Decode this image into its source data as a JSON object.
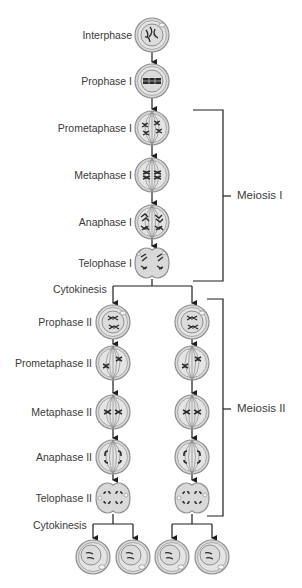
{
  "diagram": {
    "title": "Meiosis",
    "colors": {
      "line": "#1e1e1e",
      "cell_outer": "#a9a9a9",
      "cell_fill": "#d9d9d9",
      "cell_inner": "#ececec",
      "chromosome": "#2a2a2a",
      "text": "#3a3a3a"
    },
    "meiosis1_stages": [
      {
        "label": "Interphase",
        "icon": "interphase-cell-icon"
      },
      {
        "label": "Prophase I",
        "icon": "prophase-i-cell-icon"
      },
      {
        "label": "Prometaphase I",
        "icon": "prometaphase-i-cell-icon"
      },
      {
        "label": "Metaphase I",
        "icon": "metaphase-i-cell-icon"
      },
      {
        "label": "Anaphase I",
        "icon": "anaphase-i-cell-icon"
      },
      {
        "label": "Telophase I",
        "icon": "telophase-i-cell-icon"
      }
    ],
    "cytokinesis1_label": "Cytokinesis",
    "meiosis2_stages": [
      {
        "label": "Prophase II",
        "icon": "prophase-ii-cell-icon"
      },
      {
        "label": "Prometaphase II",
        "icon": "prometaphase-ii-cell-icon"
      },
      {
        "label": "Metaphase II",
        "icon": "metaphase-ii-cell-icon"
      },
      {
        "label": "Anaphase II",
        "icon": "anaphase-ii-cell-icon"
      },
      {
        "label": "Telophase II",
        "icon": "telophase-ii-cell-icon"
      }
    ],
    "cytokinesis2_label": "Cytokinesis",
    "final_cells": [
      {
        "icon": "haploid-cell-icon"
      },
      {
        "icon": "haploid-cell-icon"
      },
      {
        "icon": "haploid-cell-icon"
      },
      {
        "icon": "haploid-cell-icon"
      }
    ],
    "brackets": {
      "meiosis1": "Meiosis I",
      "meiosis2": "Meiosis II"
    }
  }
}
